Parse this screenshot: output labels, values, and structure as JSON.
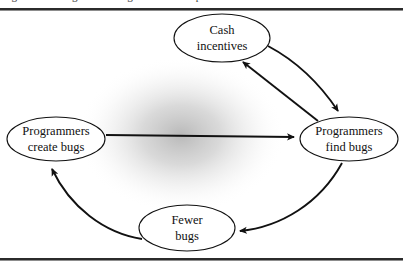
{
  "figure": {
    "clipped_caption_above_rule": "Figure 3-1. Programmer bug incentive loop",
    "title": "",
    "background_color": "#ffffff",
    "line_color": "#1a1a1a",
    "text_color": "#111111",
    "shadow_blob_color": "#9a9a9a",
    "rules": {
      "top_present": true,
      "bottom_present": true,
      "rule_color": "#2b2b2b"
    }
  },
  "diagram": {
    "type": "causal-loop",
    "nodes": [
      {
        "id": "cash-incentives",
        "line1": "Cash",
        "line2": "incentives",
        "cx": 222,
        "cy": 27,
        "rx": 48,
        "ry": 24
      },
      {
        "id": "programmers-create-bugs",
        "line1": "Programmers",
        "line2": "create bugs",
        "cx": 56,
        "cy": 128,
        "rx": 49,
        "ry": 22
      },
      {
        "id": "programmers-find-bugs",
        "line1": "Programmers",
        "line2": "find bugs",
        "cx": 349,
        "cy": 128,
        "rx": 49,
        "ry": 22
      },
      {
        "id": "fewer-bugs",
        "line1": "Fewer",
        "line2": "bugs",
        "cx": 187,
        "cy": 217,
        "rx": 48,
        "ry": 23
      }
    ],
    "edges": [
      {
        "id": "create-to-find",
        "from": "programmers-create-bugs",
        "to": "programmers-find-bugs",
        "shape": "straight",
        "label": ""
      },
      {
        "id": "cash-to-find",
        "from": "cash-incentives",
        "to": "programmers-find-bugs",
        "shape": "curve",
        "label": ""
      },
      {
        "id": "find-to-cash",
        "from": "programmers-find-bugs",
        "to": "cash-incentives",
        "shape": "straight",
        "label": ""
      },
      {
        "id": "find-to-fewer",
        "from": "programmers-find-bugs",
        "to": "fewer-bugs",
        "shape": "curve",
        "label": ""
      },
      {
        "id": "fewer-to-create",
        "from": "fewer-bugs",
        "to": "programmers-create-bugs",
        "shape": "curve",
        "label": ""
      }
    ]
  }
}
